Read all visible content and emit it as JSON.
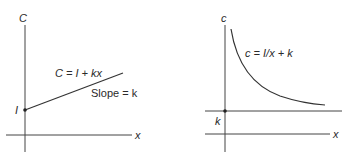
{
  "figure_left": {
    "y_axis_label": "C",
    "x_axis_label": "x",
    "intercept_label": "I",
    "equation": "C = I + kx",
    "slope_label": "Slope = k"
  },
  "figure_right": {
    "y_axis_label": "c",
    "x_axis_label": "x",
    "asymptote_label": "k",
    "equation": "c = I/x + k"
  },
  "colors": {
    "ink": "#2a2a2a",
    "background": "#ffffff"
  }
}
